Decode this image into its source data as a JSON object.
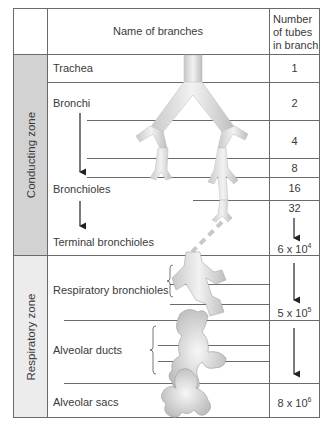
{
  "header": {
    "name_col": "Name of branches",
    "number_col_line1": "Number",
    "number_col_line2": "of tubes",
    "number_col_line3": "in branch"
  },
  "zones": [
    {
      "label": "Conducting zone",
      "color": "#d2d2d2"
    },
    {
      "label": "Respiratory zone",
      "color": "#ececec"
    }
  ],
  "branches": [
    {
      "name": "Trachea",
      "count": "1"
    },
    {
      "name": "Bronchi",
      "count": "2"
    },
    {
      "name": "",
      "count": "4"
    },
    {
      "name": "",
      "count": "8"
    },
    {
      "name": "Bronchioles",
      "count": "16"
    },
    {
      "name": "",
      "count": "32"
    },
    {
      "name": "Terminal bronchioles",
      "count_base": "6 x 10",
      "count_exp": "4"
    },
    {
      "name": "Respiratory bronchioles",
      "count_base": "5 x 10",
      "count_exp": "5"
    },
    {
      "name": "Alveolar ducts",
      "count": ""
    },
    {
      "name": "Alveolar sacs",
      "count_base": "8 x 10",
      "count_exp": "6"
    }
  ]
}
